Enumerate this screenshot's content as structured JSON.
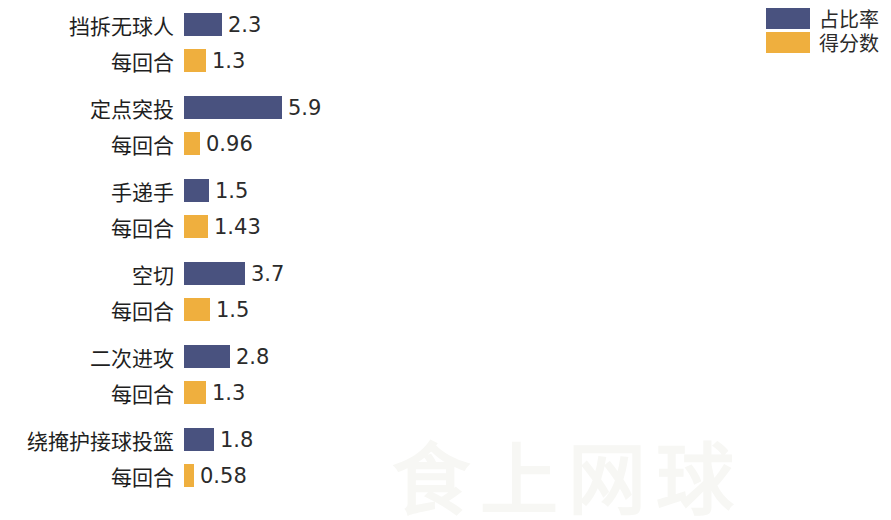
{
  "colors": {
    "series_share": "#49527f",
    "series_points": "#efaf3e",
    "text": "#1f1f1f",
    "background": "#ffffff",
    "watermark": "#f7f7f4"
  },
  "legend": {
    "items": [
      {
        "label": "占比率",
        "color": "#49527f",
        "swatch_name": "legend-swatch-share"
      },
      {
        "label": "得分数",
        "color": "#efaf3e",
        "swatch_name": "legend-swatch-points"
      }
    ]
  },
  "watermark": {
    "text": "食上网球"
  },
  "chart_data": {
    "type": "bar",
    "orientation": "horizontal",
    "title": "",
    "xlabel": "",
    "ylabel": "",
    "grid": false,
    "legend_position": "top-right",
    "categories": [
      "挡拆无球人",
      "定点突投",
      "手递手",
      "空切",
      "二次进攻",
      "绕掩护接球投篮"
    ],
    "sub_label": "每回合",
    "series": [
      {
        "name": "占比率",
        "color": "#49527f",
        "values": [
          2.3,
          5.9,
          1.5,
          3.7,
          2.8,
          1.8
        ],
        "value_labels": [
          "2.3",
          "5.9",
          "1.5",
          "3.7",
          "2.8",
          "1.8"
        ]
      },
      {
        "name": "得分数",
        "color": "#efaf3e",
        "values": [
          1.3,
          0.96,
          1.43,
          1.5,
          1.3,
          0.58
        ],
        "value_labels": [
          "1.3",
          "0.96",
          "1.43",
          "1.5",
          "1.3",
          "0.58"
        ]
      }
    ]
  }
}
